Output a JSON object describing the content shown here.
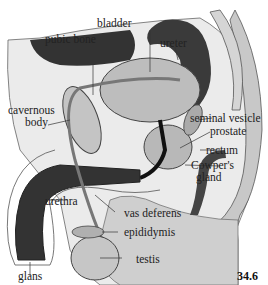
{
  "figure": {
    "number": "34.6",
    "labels": {
      "bladder": "bladder",
      "pubic_bone": "pubic bone",
      "ureter": "ureter",
      "cavernous_body_line1": "cavernous",
      "cavernous_body_line2": "body",
      "seminal_vesicle": "seminal vesicle",
      "prostate": "prostate",
      "rectum": "rectum",
      "cowpers_gland_line1": "Cowper's",
      "cowpers_gland_line2": "gland",
      "urethra": "urethra",
      "vas_deferens": "vas deferens",
      "epididymis": "epididymis",
      "testis": "testis",
      "glans": "glans"
    },
    "colors": {
      "body_fill": "#c8c8c8",
      "skin_light": "#ebebeb",
      "dark_tissue": "#3a3a3a",
      "organ_fill": "#bdbdbd",
      "outline": "#444444",
      "text": "#222222"
    }
  }
}
